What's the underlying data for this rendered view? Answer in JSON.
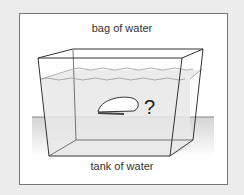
{
  "diagram": {
    "top_label": "bag of water",
    "bottom_label": "tank of water",
    "question_mark": "?",
    "colors": {
      "background": "#ececec",
      "frame": "#ffffff",
      "water": "#e6e6e6",
      "lines": "#333333"
    }
  }
}
